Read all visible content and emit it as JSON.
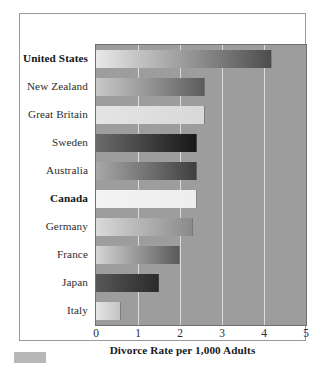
{
  "chart_data": {
    "type": "bar",
    "orientation": "horizontal",
    "title": "",
    "xlabel": "Divorce Rate per 1,000 Adults",
    "ylabel": "",
    "xlim": [
      0,
      5
    ],
    "xticks": [
      "0",
      "1",
      "2",
      "3",
      "4",
      "5"
    ],
    "grid": true,
    "legend": "none",
    "categories": [
      "United States",
      "New Zealand",
      "Great Britain",
      "Sweden",
      "Australia",
      "Canada",
      "Germany",
      "France",
      "Japan",
      "Italy"
    ],
    "values": [
      4.2,
      2.6,
      2.6,
      2.4,
      2.4,
      2.4,
      2.3,
      2.0,
      1.5,
      0.6
    ],
    "highlighted": [
      "United States",
      "Canada"
    ],
    "bars": [
      {
        "label": "United States",
        "value": 4.2,
        "bold": true,
        "fill_start": "#e9e9e9",
        "fill_end": "#4d4d4d"
      },
      {
        "label": "New Zealand",
        "value": 2.6,
        "bold": false,
        "fill_start": "#c9c9c9",
        "fill_end": "#5c5c5c"
      },
      {
        "label": "Great Britain",
        "value": 2.6,
        "bold": false,
        "fill_start": "#e4e4e4",
        "fill_end": "#d8d8d8"
      },
      {
        "label": "Sweden",
        "value": 2.4,
        "bold": false,
        "fill_start": "#6b6b6b",
        "fill_end": "#181818"
      },
      {
        "label": "Australia",
        "value": 2.4,
        "bold": false,
        "fill_start": "#a8a8a8",
        "fill_end": "#3f3f3f"
      },
      {
        "label": "Canada",
        "value": 2.4,
        "bold": true,
        "fill_start": "#f3f3f3",
        "fill_end": "#ededed"
      },
      {
        "label": "Germany",
        "value": 2.3,
        "bold": false,
        "fill_start": "#dadada",
        "fill_end": "#8a8a8a"
      },
      {
        "label": "France",
        "value": 2.0,
        "bold": false,
        "fill_start": "#d5d5d5",
        "fill_end": "#5a5a5a"
      },
      {
        "label": "Japan",
        "value": 1.5,
        "bold": false,
        "fill_start": "#575757",
        "fill_end": "#2b2b2b"
      },
      {
        "label": "Italy",
        "value": 0.6,
        "bold": false,
        "fill_start": "#e6e6e6",
        "fill_end": "#c4c4c4"
      }
    ]
  },
  "colors": {
    "plot_background": "#9d9d9d",
    "gridline": "#e8e8e8",
    "frame_border": "#9a9a9a",
    "plot_border": "#6f6f6f",
    "page_background": "#ffffff",
    "label_text": "#2c2c2c",
    "swatch": "#b8b8b8"
  }
}
